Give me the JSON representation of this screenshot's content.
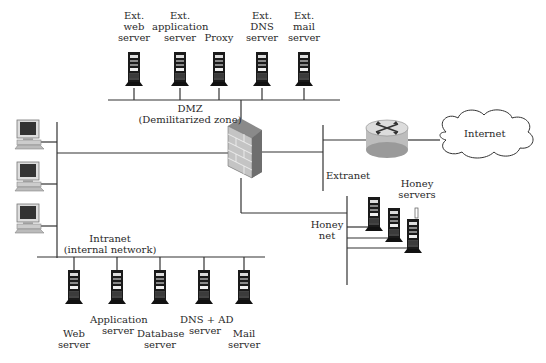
{
  "dmz": {
    "label": "DMZ",
    "sublabel": "(Demilitarized zone)",
    "servers": [
      {
        "line1": "Ext.",
        "line2": "web",
        "line3": "server"
      },
      {
        "line1": "Ext.",
        "line2": "application",
        "line3": "server"
      },
      {
        "line1": "",
        "line2": "",
        "line3": "Proxy"
      },
      {
        "line1": "Ext.",
        "line2": "DNS",
        "line3": "server"
      },
      {
        "line1": "Ext.",
        "line2": "mail",
        "line3": "server"
      }
    ]
  },
  "extranet": {
    "label": "Extranet"
  },
  "internet": {
    "label": "Internet"
  },
  "honeynet": {
    "label_line1": "Honey",
    "label_line2": "net",
    "servers_label_line1": "Honey",
    "servers_label_line2": "servers"
  },
  "intranet": {
    "label": "Intranet",
    "sublabel": "(internal network)",
    "servers": [
      {
        "line1": "Web",
        "line2": "server"
      },
      {
        "line1": "Application",
        "line2": "server"
      },
      {
        "line1": "Database",
        "line2": "server"
      },
      {
        "line1": "DNS + AD",
        "line2": "server"
      },
      {
        "line1": "Mail",
        "line2": "server"
      }
    ]
  },
  "workstations": {
    "count": 3
  },
  "colors": {
    "line": "#333333",
    "firewall": "#b8b8b8",
    "router": "#c8c8c8"
  }
}
